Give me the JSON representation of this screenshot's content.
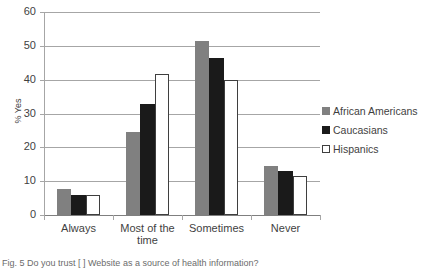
{
  "chart_data": {
    "type": "bar",
    "title": "",
    "xlabel": "",
    "ylabel": "% Yes",
    "ylim": [
      0,
      60
    ],
    "yticks": [
      0,
      10,
      20,
      30,
      40,
      50,
      60
    ],
    "grid": true,
    "legend_position": "right",
    "categories": [
      "Always",
      "Most of the time",
      "Sometimes",
      "Never"
    ],
    "series": [
      {
        "name": "African Americans",
        "color": "#808080",
        "values": [
          7.8,
          24.5,
          51.5,
          14.5
        ]
      },
      {
        "name": "Caucasians",
        "color": "#1a1a1a",
        "values": [
          6.0,
          32.8,
          46.5,
          13.0
        ]
      },
      {
        "name": "Hispanics",
        "color": "#ffffff",
        "values": [
          6.0,
          41.8,
          40.0,
          11.5
        ]
      }
    ]
  },
  "axis": {
    "y_title": "% Yes",
    "y_tick_labels": [
      "60",
      "50",
      "40",
      "30",
      "20",
      "10",
      "0"
    ],
    "x_tick_labels": [
      {
        "line1": "Always",
        "line2": ""
      },
      {
        "line1": "Most of the",
        "line2": "time"
      },
      {
        "line1": "Sometimes",
        "line2": ""
      },
      {
        "line1": "Never",
        "line2": ""
      }
    ]
  },
  "legend": {
    "items": [
      {
        "label": "African Americans",
        "swatch": "s0"
      },
      {
        "label": "Caucasians",
        "swatch": "s1"
      },
      {
        "label": "Hispanics",
        "swatch": "s2"
      }
    ]
  },
  "caption": {
    "text": "Fig. 5  Do you trust [ ] Website as a source of health information?"
  }
}
